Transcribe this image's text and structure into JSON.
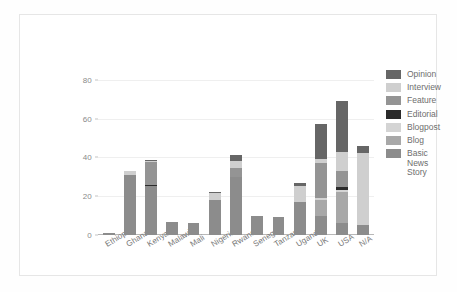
{
  "chart_data": {
    "type": "bar",
    "subtype": "stacked-bar",
    "title": "",
    "xlabel": "",
    "ylabel": "",
    "ylim": [
      0,
      85
    ],
    "yticks": [
      0,
      20,
      40,
      60,
      80
    ],
    "grid": true,
    "legend_position": "right",
    "categories": [
      "Ethiopia",
      "Ghana",
      "Kenya",
      "Malawi",
      "Mali",
      "Nigeria",
      "Rwanda",
      "Senegal",
      "Tanzania",
      "Uganda",
      "UK",
      "USA",
      "N/A"
    ],
    "series": [
      {
        "name": "Basic News Story",
        "color": "#8c8c8c",
        "values": [
          1,
          31,
          25,
          6.5,
          6,
          18,
          30,
          10,
          9.5,
          17,
          10,
          6,
          5
        ]
      },
      {
        "name": "Blog",
        "color": "#a8a8a8",
        "values": [
          0,
          0,
          0,
          0,
          0,
          0,
          0,
          0,
          0,
          0,
          8,
          16,
          0
        ]
      },
      {
        "name": "Blogpost",
        "color": "#d4d4d4",
        "values": [
          0,
          0,
          0,
          0,
          0,
          0,
          0,
          0,
          0,
          0,
          1,
          1,
          0
        ]
      },
      {
        "name": "Editorial",
        "color": "#2b2b2b",
        "values": [
          0,
          0,
          0.8,
          0,
          0,
          0,
          0,
          0,
          0,
          0,
          0,
          2,
          0
        ]
      },
      {
        "name": "Feature",
        "color": "#949494",
        "values": [
          0,
          0,
          11.7,
          0,
          0,
          0,
          4.5,
          0,
          0,
          0,
          18,
          8,
          0
        ]
      },
      {
        "name": "Interview",
        "color": "#cfcfcf",
        "values": [
          0,
          1.8,
          0.5,
          0.3,
          0,
          3.5,
          3.5,
          0,
          0,
          8.5,
          2,
          10,
          37
        ]
      },
      {
        "name": "Opinion",
        "color": "#666666",
        "values": [
          0,
          0.3,
          0.5,
          0,
          0,
          0.7,
          3,
          0,
          0,
          1.5,
          18,
          26,
          4
        ]
      }
    ],
    "totals": [
      1,
      33.1,
      38.5,
      6.8,
      6,
      22.2,
      41,
      10,
      9.5,
      27,
      57,
      69,
      46
    ],
    "legend_entries": [
      "Opinion",
      "Interview",
      "Feature",
      "Editorial",
      "Blogpost",
      "Blog",
      "Basic\nNews\nStory"
    ],
    "colors": {
      "opinion": "#666666",
      "interview": "#cfcfcf",
      "feature": "#949494",
      "editorial": "#2b2b2b",
      "blogpost": "#d4d4d4",
      "blog": "#a8a8a8",
      "basic_news_story": "#8c8c8c",
      "gridline": "#efefef",
      "axis": "#b8b8b8",
      "tick_text": "#8a8a8a",
      "frame": "#e6e6e6",
      "background": "#ffffff"
    }
  }
}
